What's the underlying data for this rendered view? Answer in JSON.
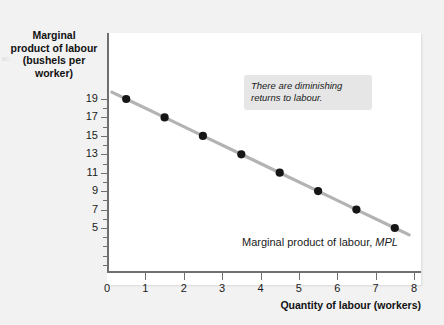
{
  "chart_data": {
    "type": "line",
    "title": "",
    "xlabel": "Quantity of labour (workers)",
    "ylabel": "Marginal product of labour (bushels per worker)",
    "xlim": [
      0,
      8
    ],
    "ylim": [
      0,
      20
    ],
    "grid": false,
    "legend": "none",
    "x": [
      0.5,
      1.5,
      2.5,
      3.5,
      4.5,
      5.5,
      6.5,
      7.5
    ],
    "values": [
      19,
      17,
      15,
      13,
      11,
      9,
      7,
      5
    ],
    "series": [
      {
        "name": "Marginal product of labour, MPL",
        "x": [
          0.5,
          1.5,
          2.5,
          3.5,
          4.5,
          5.5,
          6.5,
          7.5
        ],
        "values": [
          19,
          17,
          15,
          13,
          11,
          9,
          7,
          5
        ]
      }
    ],
    "x_ticks": [
      "0",
      "1",
      "2",
      "3",
      "4",
      "5",
      "6",
      "7",
      "8"
    ],
    "x_tick_values": [
      0,
      1,
      2,
      3,
      4,
      5,
      6,
      7,
      8
    ],
    "y_ticks": [
      "19",
      "17",
      "15",
      "13",
      "11",
      "9",
      "7",
      "5"
    ],
    "y_tick_values": [
      19,
      17,
      15,
      13,
      11,
      9,
      7,
      5
    ],
    "annotations": [
      {
        "name": "diminishing-returns-note",
        "text": "There are diminishing returns to labour."
      }
    ],
    "series_label": {
      "text": "Marginal product of labour, ",
      "emphasis": "MPL"
    },
    "colors": {
      "line": "#b3b3b3",
      "marker": "#161616",
      "axis": "#6f6f6f",
      "panel": "#ffffff",
      "page": "#f2f2f2",
      "annotation_bg": "#e6e6e6",
      "text": "#1a1a1a"
    }
  },
  "axes": {
    "y_title_lines": [
      "Marginal",
      "product of labour",
      "(bushels per",
      "worker)"
    ],
    "x_title": "Quantity of labour (workers)"
  },
  "annotation": {
    "line1": "There are diminishing",
    "line2": "returns to labour."
  },
  "series_label": {
    "prefix": "Marginal product of labour,",
    "symbol": "MPL"
  }
}
